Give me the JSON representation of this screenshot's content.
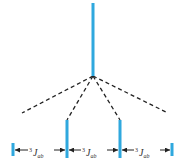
{
  "diagram": {
    "type": "nmr-splitting-tree",
    "colors": {
      "peak": "#2fa8de",
      "dash": "#222222",
      "arrow": "#222222",
      "background": "#ffffff"
    },
    "parent_peak": {
      "x": 93,
      "y_top": 3,
      "y_bottom": 76
    },
    "child_peaks": [
      {
        "x": 13,
        "y_top": 143,
        "y_bottom": 156
      },
      {
        "x": 67,
        "y_top": 120,
        "y_bottom": 158
      },
      {
        "x": 120,
        "y_top": 120,
        "y_bottom": 158
      },
      {
        "x": 172,
        "y_top": 143,
        "y_bottom": 156
      }
    ],
    "dashed_lines": [
      {
        "x2": 22,
        "y2": 113
      },
      {
        "x2": 67,
        "y2": 120
      },
      {
        "x2": 120,
        "y2": 120
      },
      {
        "x2": 168,
        "y2": 113
      }
    ],
    "couplings": [
      {
        "sup": "3",
        "symbol": "J",
        "sub": "ab"
      },
      {
        "sup": "3",
        "symbol": "J",
        "sub": "ab"
      },
      {
        "sup": "3",
        "symbol": "J",
        "sub": "ab"
      }
    ]
  }
}
